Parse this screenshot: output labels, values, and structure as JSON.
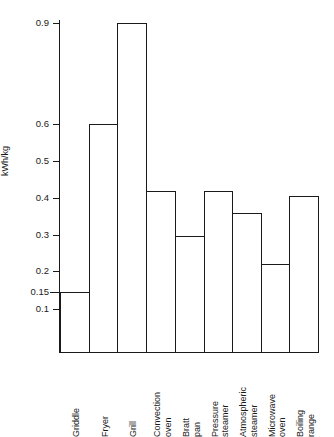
{
  "chart_data": {
    "type": "bar",
    "title": "",
    "xlabel": "",
    "ylabel": "kWh/kg",
    "grid": false,
    "legend": null,
    "axis_note": "non-linear y axis; tick 0.15 inserted between 0.1 and 0.2 and the 0.6-0.9 span is compressed",
    "ytick_labels": [
      "0.9",
      "0.6",
      "0.5",
      "0.4",
      "0.3",
      "0.2",
      "0.15",
      "0.1"
    ],
    "ytick_values": [
      0.9,
      0.6,
      0.5,
      0.4,
      0.3,
      0.2,
      0.15,
      0.1
    ],
    "ytick_pixels": [
      23,
      124,
      161,
      198,
      235,
      271,
      292,
      309
    ],
    "baseline_pixel": 352,
    "categories": [
      "Griddle",
      "Fryer",
      "Grill",
      "Convection oven",
      "Bratt pan",
      "Pressure steamer",
      "Atmospheric steamer",
      "Microwave oven",
      "Boiling range"
    ],
    "category_lines": [
      [
        "Griddle"
      ],
      [
        "Fryer"
      ],
      [
        "Grill"
      ],
      [
        "Convection",
        "oven"
      ],
      [
        "Bratt",
        "pan"
      ],
      [
        "Pressure",
        "steamer"
      ],
      [
        "Atmospheric",
        "steamer"
      ],
      [
        "Microwave",
        "oven"
      ],
      [
        "Boiling",
        "range"
      ]
    ],
    "values": [
      0.15,
      0.6,
      0.9,
      0.417,
      0.297,
      0.417,
      0.355,
      0.217,
      0.403
    ],
    "bar_top_pixels": [
      292,
      124,
      23,
      191,
      236,
      191,
      213,
      264,
      196
    ],
    "bar_edge_pixels": [
      60,
      89,
      117,
      146,
      175,
      204,
      232,
      261,
      289,
      318
    ],
    "bar_color": "#ffffff",
    "bar_edge_color": "#1a1a1a"
  }
}
